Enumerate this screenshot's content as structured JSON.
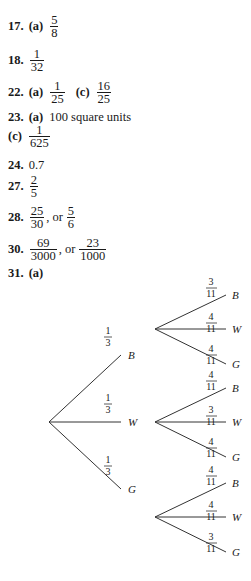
{
  "answers": {
    "a17": {
      "number": "17.",
      "part": "(a)",
      "frac": {
        "n": "5",
        "d": "8"
      }
    },
    "a18": {
      "number": "18.",
      "frac": {
        "n": "1",
        "d": "32"
      }
    },
    "a22": {
      "number": "22.",
      "part_a": "(a)",
      "frac_a": {
        "n": "1",
        "d": "25"
      },
      "part_c": "(c)",
      "frac_c": {
        "n": "16",
        "d": "25"
      }
    },
    "a23": {
      "number": "23.",
      "part_a": "(a)",
      "text_a": "100 square units",
      "part_c": "(c)",
      "frac_c": {
        "n": "1",
        "d": "625"
      }
    },
    "a24": {
      "number": "24.",
      "text": "0.7"
    },
    "a27": {
      "number": "27.",
      "frac": {
        "n": "2",
        "d": "5"
      }
    },
    "a28": {
      "number": "28.",
      "frac1": {
        "n": "25",
        "d": "30"
      },
      "sep": ", or",
      "frac2": {
        "n": "5",
        "d": "6"
      }
    },
    "a30": {
      "number": "30.",
      "frac1": {
        "n": "69",
        "d": "3000"
      },
      "sep": ", or",
      "frac2": {
        "n": "23",
        "d": "1000"
      }
    },
    "a31": {
      "number": "31.",
      "part": "(a)"
    }
  },
  "tree": {
    "first_level": [
      {
        "prob_n": "1",
        "prob_d": "3",
        "outcome": "B"
      },
      {
        "prob_n": "1",
        "prob_d": "3",
        "outcome": "W"
      },
      {
        "prob_n": "1",
        "prob_d": "3",
        "outcome": "G"
      }
    ],
    "second_level": [
      {
        "from": "B",
        "branches": [
          {
            "prob_n": "3",
            "prob_d": "11",
            "outcome": "B"
          },
          {
            "prob_n": "4",
            "prob_d": "11",
            "outcome": "W"
          },
          {
            "prob_n": "4",
            "prob_d": "11",
            "outcome": "G"
          }
        ]
      },
      {
        "from": "W",
        "branches": [
          {
            "prob_n": "4",
            "prob_d": "11",
            "outcome": "B"
          },
          {
            "prob_n": "3",
            "prob_d": "11",
            "outcome": "W"
          },
          {
            "prob_n": "4",
            "prob_d": "11",
            "outcome": "G"
          }
        ]
      },
      {
        "from": "G",
        "branches": [
          {
            "prob_n": "4",
            "prob_d": "11",
            "outcome": "B"
          },
          {
            "prob_n": "4",
            "prob_d": "11",
            "outcome": "W"
          },
          {
            "prob_n": "3",
            "prob_d": "11",
            "outcome": "G"
          }
        ]
      }
    ]
  }
}
